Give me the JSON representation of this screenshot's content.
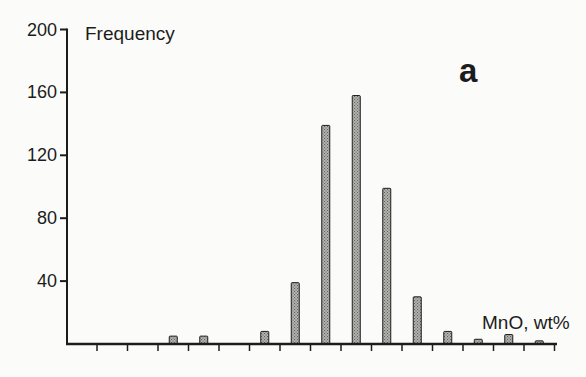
{
  "figure": {
    "background": "#fbfbf9",
    "ink": "#1c1c1c"
  },
  "chart_data": {
    "type": "bar",
    "title": "",
    "ylabel": "Frequency",
    "xlabel": "MnO, wt%",
    "panel_label": "a",
    "ylim": [
      0,
      200
    ],
    "yticks": [
      200,
      160,
      120,
      80,
      40
    ],
    "x_tick_count": 16,
    "x_tick_labels": [],
    "grid": false,
    "legend": false,
    "bar_fill": "#b6b6b3",
    "bar_dot": "#60605c",
    "bar_stroke": "#1c1c1c",
    "note": "Histogram of MnO wt% vs Frequency; x-axis ticks carry no numeric labels. Each bar sits midway between two adjacent ticks; bin_index is the 0-based tick-interval index counted from the first tick.",
    "bars": [
      {
        "bin_index": 2,
        "frequency": 5
      },
      {
        "bin_index": 3,
        "frequency": 5
      },
      {
        "bin_index": 5,
        "frequency": 8
      },
      {
        "bin_index": 6,
        "frequency": 39
      },
      {
        "bin_index": 7,
        "frequency": 139
      },
      {
        "bin_index": 8,
        "frequency": 158
      },
      {
        "bin_index": 9,
        "frequency": 99
      },
      {
        "bin_index": 10,
        "frequency": 30
      },
      {
        "bin_index": 11,
        "frequency": 8
      },
      {
        "bin_index": 12,
        "frequency": 3
      },
      {
        "bin_index": 13,
        "frequency": 6
      },
      {
        "bin_index": 14,
        "frequency": 2
      }
    ]
  }
}
